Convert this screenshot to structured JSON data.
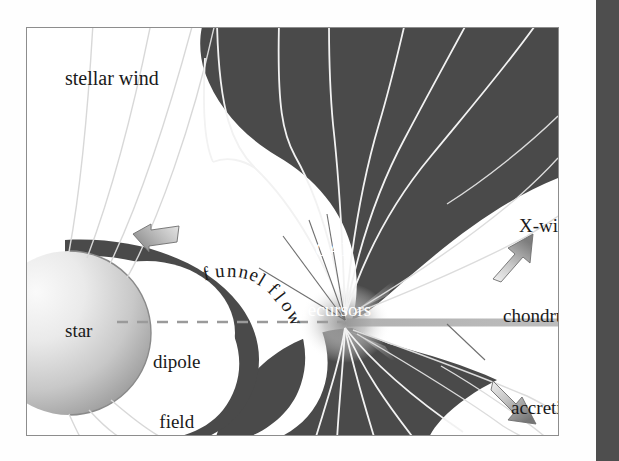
{
  "figure": {
    "frame": {
      "border_color": "#8d8d8d",
      "background": "#ffffff"
    }
  },
  "colors": {
    "dark_lobe": "#4a4a4a",
    "field_line": "#f2f2f2",
    "thin_leader": "#707070",
    "dashed_line": "#9a9a9a",
    "background": "#ffffff",
    "page_edge_bar": "#4e4e4e",
    "text_dark": "#1a1a1a",
    "text_light": "#ffffff",
    "star_light": "#f0f0f0",
    "star_dark": "#9e9e9e",
    "arrow_light": "#e8e8e8",
    "arrow_dark": "#8a8a8a",
    "disk_gray": "#b4b4b4"
  },
  "labels": {
    "stellar_wind": "stellar wind",
    "star": "star",
    "dipole_field_line1": "dipole",
    "dipole_field_line2": "field",
    "funnel_flow": "funnel flow",
    "cai_line1": "CAI",
    "cai_line2": "precursors",
    "x_wind": "X-wind",
    "chondrules": "chondrules",
    "accretion_line1": "accretion",
    "accretion_line2": "disk"
  },
  "elements": {
    "star_sphere": "star-sphere",
    "dipole_cavity": "dipole-field-cavity",
    "funnel_band": "funnel-flow-band",
    "upper_dark_lobe": "upper-dark-lobe",
    "lower_dark_lobe": "lower-dark-lobe",
    "x_point": "x-point",
    "accretion_disk_bar": "accretion-disk-bar",
    "dashed_midplane": "dashed-midplane-line",
    "arrow_funnel": "funnel-flow-arrow",
    "arrow_xwind": "x-wind-arrow",
    "arrow_disk": "accretion-disk-arrow",
    "leader_cai": "cai-leader-lines",
    "leader_accretion": "accretion-disk-leader-line"
  },
  "icons": {
    "arrow_up_right": "arrow-up-right-icon",
    "arrow_down_right": "arrow-down-right-icon",
    "arrow_left": "arrow-left-icon"
  },
  "funnel_flow_chars": [
    {
      "c": "f",
      "x": 176,
      "y": 236,
      "r": -14
    },
    {
      "c": "u",
      "x": 188,
      "y": 233,
      "r": -5
    },
    {
      "c": "n",
      "x": 200,
      "y": 233,
      "r": 3
    },
    {
      "c": "n",
      "x": 212,
      "y": 234,
      "r": 12
    },
    {
      "c": "e",
      "x": 223,
      "y": 237,
      "r": 22
    },
    {
      "c": "l",
      "x": 232,
      "y": 242,
      "r": 31
    },
    {
      "c": " ",
      "x": 238,
      "y": 246,
      "r": 38
    },
    {
      "c": "f",
      "x": 243,
      "y": 251,
      "r": 44
    },
    {
      "c": "l",
      "x": 250,
      "y": 259,
      "r": 52
    },
    {
      "c": "o",
      "x": 256,
      "y": 268,
      "r": 59
    },
    {
      "c": "w",
      "x": 261,
      "y": 280,
      "r": 66
    }
  ]
}
